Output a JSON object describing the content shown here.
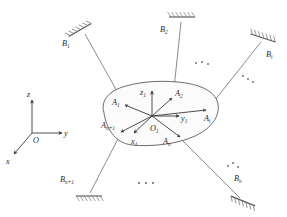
{
  "figure": {
    "title": "Parallel manipulator with n+1 legs connecting a moving platform to fixed ground supports",
    "top_partial_text": "· · ·· · ··· ·· · ·····",
    "colors": {
      "background": "#ffffff",
      "line": "#6e6e6e",
      "outline": "#5a5a5a",
      "label": "#2b2b2b",
      "body_fill": "#fbfbfb",
      "hatch": "#777777"
    }
  },
  "global_frame": {
    "origin_label": "O",
    "axes": [
      {
        "name": "x-axis",
        "label": "x"
      },
      {
        "name": "y-axis",
        "label": "y"
      },
      {
        "name": "z-axis",
        "label": "z"
      }
    ]
  },
  "body_frame": {
    "origin_label": "O",
    "origin_sub": "1",
    "axes": [
      {
        "name": "x1-axis",
        "label": "x",
        "sub": "1"
      },
      {
        "name": "y1-axis",
        "label": "y",
        "sub": "1"
      },
      {
        "name": "z1-axis",
        "label": "z",
        "sub": "1"
      }
    ]
  },
  "platform_joints": [
    {
      "name": "joint-A1",
      "label": "A",
      "sub": "1"
    },
    {
      "name": "joint-A2",
      "label": "A",
      "sub": "2"
    },
    {
      "name": "joint-Ai",
      "label": "A",
      "sub": "i"
    },
    {
      "name": "joint-An",
      "label": "A",
      "sub": "n"
    },
    {
      "name": "joint-An1",
      "label": "A",
      "sub": "n+1"
    }
  ],
  "ground_anchors": [
    {
      "name": "anchor-B1",
      "label": "B",
      "sub": "1"
    },
    {
      "name": "anchor-B2",
      "label": "B",
      "sub": "2"
    },
    {
      "name": "anchor-Bi",
      "label": "B",
      "sub": "i"
    },
    {
      "name": "anchor-Bn",
      "label": "B",
      "sub": "n"
    },
    {
      "name": "anchor-Bn1",
      "label": "B",
      "sub": "n+1"
    }
  ],
  "ellipses": [
    {
      "name": "ellipsis-upper-right",
      "text": "· · ·"
    },
    {
      "name": "ellipsis-right",
      "text": "· · ·"
    },
    {
      "name": "ellipsis-bottom",
      "text": "· · ·"
    },
    {
      "name": "ellipsis-lower-right",
      "text": "· · ·"
    }
  ]
}
